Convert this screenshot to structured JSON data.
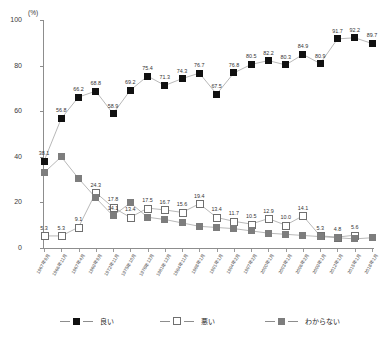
{
  "chart_data": {
    "type": "line",
    "title": "",
    "xlabel": "",
    "ylabel": "(%)",
    "ylim": [
      0,
      100
    ],
    "yticks": [
      0,
      20,
      40,
      60,
      80,
      100
    ],
    "grid": false,
    "legend_position": "bottom",
    "categories": [
      "1967年9月",
      "1966年11月",
      "1967年4月",
      "1969年9月",
      "1972年11月",
      "1975年10月",
      "1978年12月",
      "1981年12月",
      "1984年11月",
      "1988年1月",
      "1991年1月",
      "1994年2月",
      "1997年2月",
      "2000年1月",
      "2003年1月",
      "2006年2月",
      "2009年1月",
      "2012年1月",
      "2015年1月",
      "2018年1月"
    ],
    "series": [
      {
        "name": "良い",
        "color": "#111111",
        "marker": "filled-square",
        "values": [
          38.1,
          56.8,
          66.2,
          68.8,
          58.9,
          69.2,
          75.4,
          71.3,
          74.3,
          76.7,
          67.5,
          76.8,
          80.5,
          82.2,
          80.3,
          84.9,
          80.9,
          91.7,
          92.2,
          89.7
        ]
      },
      {
        "name": "悪い",
        "color": "#ffffff",
        "marker": "open-square",
        "values": [
          5.3,
          5.3,
          9.1,
          24.3,
          17.8,
          13.4,
          17.5,
          16.7,
          15.6,
          19.4,
          13.4,
          11.7,
          10.5,
          12.9,
          10.0,
          14.1,
          5.3,
          4.8,
          5.6,
          null
        ]
      },
      {
        "name": "わからない",
        "color": "#7d7d7d",
        "marker": "gray-square",
        "values": [
          33.0,
          40.0,
          30.5,
          22.0,
          14.1,
          19.8,
          13.5,
          12.5,
          11.0,
          9.5,
          9.0,
          8.5,
          7.5,
          6.5,
          6.0,
          5.5,
          5.0,
          4.5,
          4.0,
          4.5
        ]
      }
    ],
    "point_labels": {
      "良い": [
        "38.1",
        "56.8",
        "66.2",
        "68.8",
        "58.9",
        "69.2",
        "75.4",
        "71.3",
        "74.3",
        "76.7",
        "67.5",
        "76.8",
        "80.5",
        "82.2",
        "80.3",
        "84.9",
        "80.9",
        "91.7",
        "92.2",
        "89.7"
      ],
      "悪い": [
        "5.3",
        "5.3",
        "9.1",
        "24.3",
        "17.8",
        "13.4",
        "17.5",
        "16.7",
        "15.6",
        "19.4",
        "13.4",
        "11.7",
        "10.5",
        "12.9",
        "10.0",
        "14.1",
        "5.3",
        "4.8",
        "5.6",
        ""
      ],
      "わからない": [
        "",
        "",
        "",
        "",
        "14.1",
        "",
        "",
        "",
        "",
        "",
        "",
        "",
        "",
        "",
        "",
        "",
        "",
        "",
        "",
        ""
      ]
    }
  },
  "legend": {
    "items": [
      {
        "label": "良い"
      },
      {
        "label": "悪い"
      },
      {
        "label": "わからない"
      }
    ]
  }
}
